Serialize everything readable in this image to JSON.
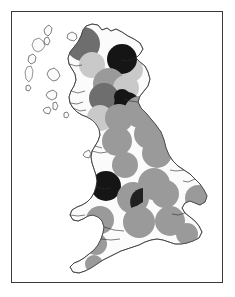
{
  "figure": {
    "frame_border_color": "#3a3a3a",
    "background_color": "#ffffff",
    "land_fill_color": "#fbfbfb",
    "coastline_color": "#2b2b2b"
  },
  "legend_shades": {
    "light_gray": "#c9c9c9",
    "medium_gray": "#9a9a9a",
    "dark_gray": "#6e6e6e",
    "black": "#151515"
  },
  "chart_data": {
    "type": "scatter",
    "xlabel": "",
    "ylabel": "",
    "grid": false,
    "legend_position": "none",
    "categories": [
      "light_gray",
      "medium_gray",
      "dark_gray",
      "black"
    ],
    "symbols": [
      {
        "name": "outer-hebrides-symbol",
        "shade": "dark_gray",
        "cx": 22,
        "cy": 26,
        "r": 0,
        "class": 3
      },
      {
        "name": "north-west-highlands-symbol",
        "shade": "dark_gray",
        "cx": 71,
        "cy": 32,
        "r": 17,
        "class": 3
      },
      {
        "name": "caithness-symbol",
        "shade": "light_gray",
        "cx": 80,
        "cy": 53,
        "r": 13,
        "class": 1
      },
      {
        "name": "moray-firth-symbol",
        "shade": "black",
        "cx": 110,
        "cy": 47,
        "r": 15,
        "class": 4
      },
      {
        "name": "aberdeenshire-symbol",
        "shade": "light_gray",
        "cx": 119,
        "cy": 58,
        "r": 12,
        "class": 1
      },
      {
        "name": "grampian-symbol",
        "shade": "medium_gray",
        "cx": 97,
        "cy": 72,
        "r": 16,
        "class": 2
      },
      {
        "name": "tayside-symbol",
        "shade": "light_gray",
        "cx": 114,
        "cy": 76,
        "r": 13,
        "class": 1
      },
      {
        "name": "central-belt-west-symbol",
        "shade": "dark_gray",
        "cx": 92,
        "cy": 86,
        "r": 15,
        "class": 3
      },
      {
        "name": "edinburgh-symbol",
        "shade": "black",
        "cx": 110,
        "cy": 85,
        "r": 8,
        "class": 4
      },
      {
        "name": "lothian-symbol",
        "shade": "black",
        "cx": 115,
        "cy": 93,
        "r": 13,
        "class": 4
      },
      {
        "name": "ayrshire-symbol",
        "shade": "light_gray",
        "cx": 88,
        "cy": 106,
        "r": 13,
        "class": 1
      },
      {
        "name": "borders-symbol",
        "shade": "medium_gray",
        "cx": 107,
        "cy": 106,
        "r": 14,
        "class": 2
      },
      {
        "name": "northumberland-symbol",
        "shade": "medium_gray",
        "cx": 128,
        "cy": 100,
        "r": 16,
        "class": 2
      },
      {
        "name": "tyne-and-wear-symbol",
        "shade": "medium_gray",
        "cx": 137,
        "cy": 122,
        "r": 15,
        "class": 2
      },
      {
        "name": "cumbria-symbol",
        "shade": "medium_gray",
        "cx": 105,
        "cy": 129,
        "r": 15,
        "class": 2
      },
      {
        "name": "yorkshire-north-symbol",
        "shade": "medium_gray",
        "cx": 145,
        "cy": 141,
        "r": 15,
        "class": 2
      },
      {
        "name": "lancashire-symbol",
        "shade": "medium_gray",
        "cx": 113,
        "cy": 153,
        "r": 13,
        "class": 2
      },
      {
        "name": "merseyside-symbol",
        "shade": "black",
        "cx": 94,
        "cy": 174,
        "r": 15,
        "class": 4
      },
      {
        "name": "yorkshire-south-symbol",
        "shade": "medium_gray",
        "cx": 142,
        "cy": 172,
        "r": 16,
        "class": 2
      },
      {
        "name": "west-midlands-symbol",
        "shade": "medium_gray",
        "cx": 121,
        "cy": 186,
        "r": 16,
        "class": 2
      },
      {
        "name": "birmingham-symbol",
        "shade": "black",
        "cx": 131,
        "cy": 190,
        "r": 14,
        "class": 4
      },
      {
        "name": "east-midlands-symbol",
        "shade": "medium_gray",
        "cx": 153,
        "cy": 182,
        "r": 14,
        "class": 2
      },
      {
        "name": "east-anglia-symbol",
        "shade": "medium_gray",
        "cx": 186,
        "cy": 186,
        "r": 13,
        "class": 2
      },
      {
        "name": "wales-north-symbol",
        "shade": "medium_gray",
        "cx": 88,
        "cy": 208,
        "r": 14,
        "class": 2
      },
      {
        "name": "wales-south-symbol",
        "shade": "medium_gray",
        "cx": 84,
        "cy": 232,
        "r": 11,
        "class": 2
      },
      {
        "name": "south-west-symbol",
        "shade": "medium_gray",
        "cx": 127,
        "cy": 210,
        "r": 16,
        "class": 2
      },
      {
        "name": "london-symbol",
        "shade": "medium_gray",
        "cx": 158,
        "cy": 209,
        "r": 15,
        "class": 2
      },
      {
        "name": "kent-symbol",
        "shade": "medium_gray",
        "cx": 175,
        "cy": 222,
        "r": 11,
        "class": 2
      },
      {
        "name": "cornwall-symbol",
        "shade": "medium_gray",
        "cx": 82,
        "cy": 252,
        "r": 9,
        "class": 2
      }
    ],
    "wedges": [
      {
        "name": "moray-black-wedge",
        "shade": "black",
        "cx": 110,
        "cy": 47,
        "r": 15
      },
      {
        "name": "birmingham-black-wedge",
        "shade": "black",
        "cx": 131,
        "cy": 190,
        "r": 14
      }
    ]
  }
}
